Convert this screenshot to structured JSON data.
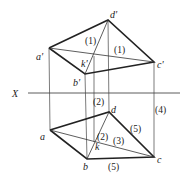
{
  "diagram": {
    "type": "orthographic-projection",
    "axis_label": "X",
    "colors": {
      "line": "#222222",
      "thin": "#444444",
      "background": "#ffffff"
    },
    "upper_view": {
      "points": {
        "a'": [
          49,
          48
        ],
        "b'": [
          85,
          74
        ],
        "c'": [
          154,
          62
        ],
        "d'": [
          108,
          20
        ],
        "k'": [
          94,
          56
        ]
      },
      "labels": {
        "a": "a'",
        "b": "b'",
        "c": "c'",
        "d": "d'",
        "k": "k'"
      },
      "annotations": [
        "(1)",
        "(1)"
      ]
    },
    "lower_view": {
      "points": {
        "a": [
          50,
          130
        ],
        "b": [
          87,
          159
        ],
        "c": [
          154,
          157
        ],
        "d": [
          109,
          112
        ],
        "k": [
          94,
          142
        ]
      },
      "labels": {
        "a": "a",
        "b": "b",
        "c": "c",
        "d": "d",
        "k": "k"
      },
      "annotations": [
        "(2)",
        "(2)",
        "(3)",
        "(4)",
        "(5)",
        "(5)"
      ]
    }
  }
}
